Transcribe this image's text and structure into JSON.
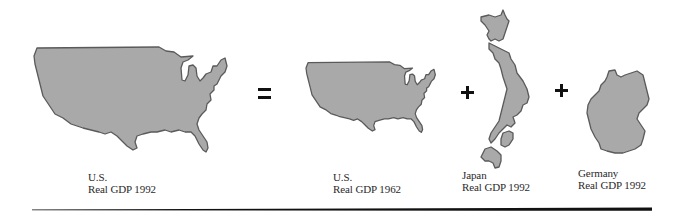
{
  "figure": {
    "equation": {
      "terms": [
        {
          "id": "us-1992",
          "country": "U.S.",
          "caption": "Real GDP 1992",
          "shape": "us-map-large"
        },
        {
          "id": "us-1962",
          "country": "U.S.",
          "caption": "Real GDP 1962",
          "shape": "us-map-small"
        },
        {
          "id": "japan-1992",
          "country": "Japan",
          "caption": "Real GDP 1992",
          "shape": "japan-map"
        },
        {
          "id": "germany-1992",
          "country": "Germany",
          "caption": "Real GDP 1992",
          "shape": "germany-map"
        }
      ],
      "operators": [
        "=",
        "+",
        "+"
      ]
    },
    "colors": {
      "map_fill": "#a9a9a9",
      "map_stroke": "#5a5a5a",
      "operator": "#111111",
      "rule": "#111111",
      "text": "#2a2a2a"
    }
  }
}
